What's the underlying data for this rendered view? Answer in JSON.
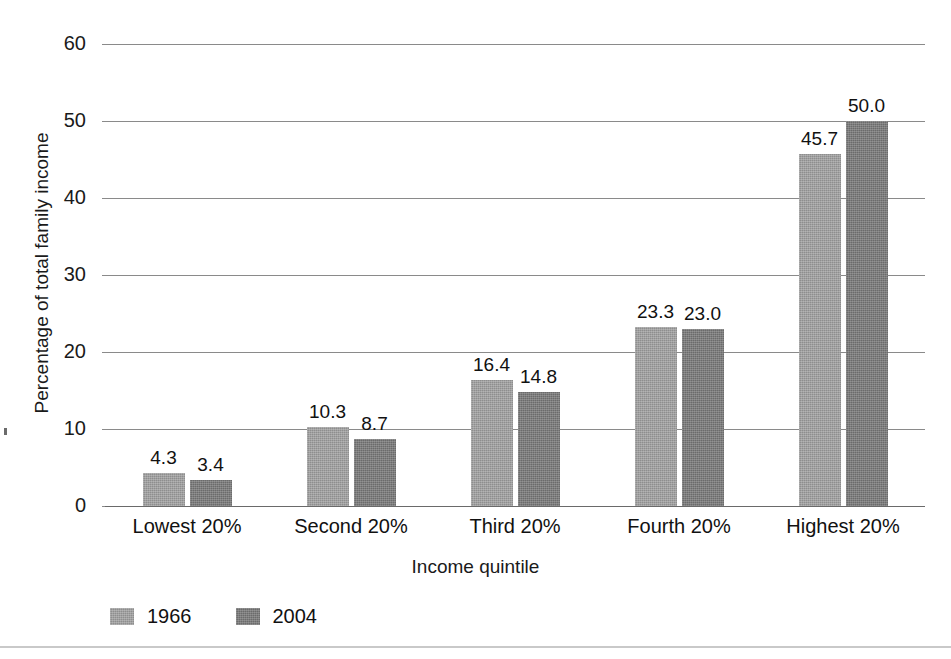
{
  "chart_data": {
    "type": "bar",
    "title": "",
    "xlabel": "Income quintile",
    "ylabel": "Percentage of total family income",
    "categories": [
      "Lowest 20%",
      "Second 20%",
      "Third 20%",
      "Fourth 20%",
      "Highest 20%"
    ],
    "series": [
      {
        "name": "1966",
        "color": "#8e8e8e",
        "values": [
          4.3,
          10.3,
          16.4,
          23.3,
          45.7
        ]
      },
      {
        "name": "2004",
        "color": "#6b6b6b",
        "values": [
          3.4,
          8.7,
          14.8,
          23.0,
          50.0
        ]
      }
    ],
    "value_labels": {
      "1966": [
        "4.3",
        "10.3",
        "16.4",
        "23.3",
        "45.7"
      ],
      "2004": [
        "3.4",
        "8.7",
        "14.8",
        "23.0",
        "50.0"
      ]
    },
    "ylim": [
      0,
      60
    ],
    "ytick_labels": [
      "60",
      "50",
      "40",
      "30",
      "20",
      "10",
      "0"
    ],
    "ytick_values": [
      60,
      50,
      40,
      30,
      20,
      10,
      0
    ],
    "grid": true,
    "legend_position": "bottom-left"
  },
  "legend": {
    "items": [
      {
        "label": "1966",
        "color": "#8e8e8e"
      },
      {
        "label": "2004",
        "color": "#6b6b6b"
      }
    ]
  }
}
